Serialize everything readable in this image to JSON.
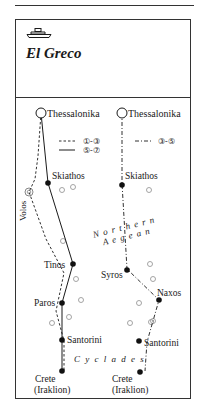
{
  "header": {
    "icon": "ferry-ship-icon",
    "title": "El Greco"
  },
  "legend": {
    "dashed": "①-③",
    "solid": "⑤-⑦",
    "dashdot": "③-⑤"
  },
  "left_route": {
    "start": "Thessalonika",
    "stops": [
      "Skiathos",
      "Tinos",
      "Paros",
      "Santorini"
    ],
    "end_line1": "Crete",
    "end_line2": "(Iraklion)",
    "side_port": "Volos"
  },
  "right_route": {
    "start": "Thessalonika",
    "stops": [
      "Skiathos",
      "Syros",
      "Naxos",
      "Santorini"
    ],
    "end_line1": "Crete",
    "end_line2": "(Iraklion)"
  },
  "regions": {
    "northern_aegean_line1": "N o r t h e r n",
    "northern_aegean_line2": "A e g e a n",
    "cyclades": "C y c l a d e s"
  },
  "colors": {
    "ink": "#1a1a1a",
    "island": "#9a9a9a"
  }
}
